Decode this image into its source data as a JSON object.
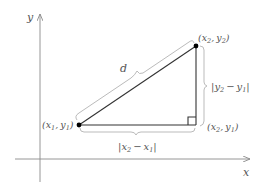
{
  "diagram": {
    "axes": {
      "x_label": "x",
      "y_label": "y"
    },
    "points": {
      "p1": {
        "label_x": "x",
        "label_x_sub": "1",
        "label_y": "y",
        "label_y_sub": "1"
      },
      "p2": {
        "label_x": "x",
        "label_x_sub": "2",
        "label_y": "y",
        "label_y_sub": "2"
      },
      "p3": {
        "label_x": "x",
        "label_x_sub": "2",
        "label_y": "y",
        "label_y_sub": "1"
      }
    },
    "labels": {
      "hypotenuse": "d",
      "vertical_var": "y",
      "vertical_sub_a": "2",
      "vertical_sub_b": "1",
      "horizontal_var": "x",
      "horizontal_sub_a": "2",
      "horizontal_sub_b": "1",
      "minus": "−",
      "abs_bar": "|",
      "open_paren": "(",
      "close_paren": ")",
      "comma": ","
    },
    "colors": {
      "axis": "#8a8a8a",
      "edge": "#333333",
      "brace": "#bbbbbb",
      "point": "#000000",
      "text": "#555555"
    }
  }
}
